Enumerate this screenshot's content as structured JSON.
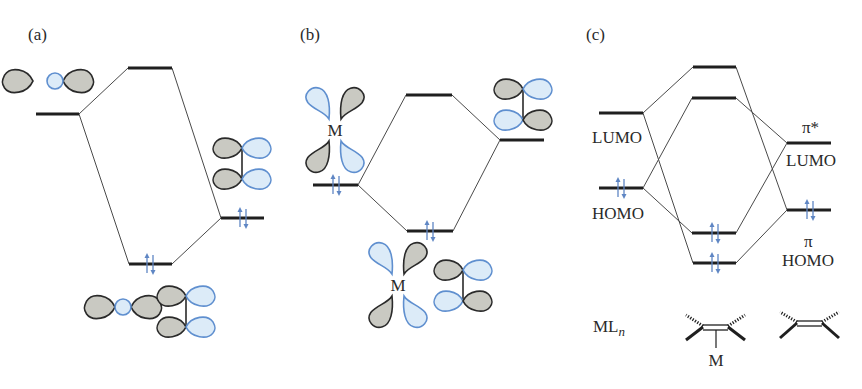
{
  "figure": {
    "panels": [
      {
        "id": "a",
        "label": "(a)",
        "levels": [
          {
            "name": "ligand-sigma-orbital",
            "x1": 36,
            "x2": 79,
            "y": 114,
            "electrons": 0
          },
          {
            "name": "antibonding",
            "x1": 128,
            "x2": 172,
            "y": 68,
            "electrons": 0
          },
          {
            "name": "bonding",
            "x1": 129,
            "x2": 172,
            "y": 264,
            "electrons": 2
          },
          {
            "name": "alkene-pi",
            "x1": 221,
            "x2": 264,
            "y": 218,
            "electrons": 2
          }
        ]
      },
      {
        "id": "b",
        "label": "(b)",
        "metal_label": "M",
        "levels": [
          {
            "name": "metal-d-orbital",
            "x1": 313,
            "x2": 358,
            "y": 185,
            "electrons": 2
          },
          {
            "name": "antibonding",
            "x1": 406,
            "x2": 452,
            "y": 95,
            "electrons": 0
          },
          {
            "name": "bonding",
            "x1": 407,
            "x2": 453,
            "y": 231,
            "electrons": 2
          },
          {
            "name": "alkene-pi-star",
            "x1": 500,
            "x2": 544,
            "y": 140,
            "electrons": 0
          }
        ]
      },
      {
        "id": "c",
        "label": "(c)",
        "left_labels": {
          "lumo": "LUMO",
          "homo": "HOMO"
        },
        "right_labels": {
          "pi_star": "π*",
          "lumo": "LUMO",
          "pi": "π",
          "homo": "HOMO"
        },
        "bottom_labels": {
          "mln_main": "ML",
          "mln_sub": "n",
          "metal": "M"
        },
        "levels": [
          {
            "name": "metal-lumo",
            "x1": 599,
            "x2": 643,
            "y": 113,
            "electrons": 0
          },
          {
            "name": "metal-homo",
            "x1": 599,
            "x2": 643,
            "y": 188,
            "electrons": 2
          },
          {
            "name": "complex-level-1",
            "x1": 693,
            "x2": 736,
            "y": 67,
            "electrons": 0
          },
          {
            "name": "complex-level-2",
            "x1": 692,
            "x2": 736,
            "y": 98,
            "electrons": 0
          },
          {
            "name": "complex-level-3",
            "x1": 692,
            "x2": 736,
            "y": 233,
            "electrons": 2
          },
          {
            "name": "complex-level-4",
            "x1": 693,
            "x2": 736,
            "y": 263,
            "electrons": 2
          },
          {
            "name": "alkene-pi-star-lumo",
            "x1": 787,
            "x2": 831,
            "y": 143,
            "electrons": 0
          },
          {
            "name": "alkene-pi-homo",
            "x1": 787,
            "x2": 831,
            "y": 210,
            "electrons": 2
          }
        ]
      }
    ],
    "colors": {
      "level": "#1f1f1f",
      "connector": "#4a4a4a",
      "lobe_gray": "#c9c9c2",
      "lobe_blue_fill": "#dcebf8",
      "lobe_blue_stroke": "#5f8fcf",
      "electron_arrow": "#5f86c4"
    }
  }
}
